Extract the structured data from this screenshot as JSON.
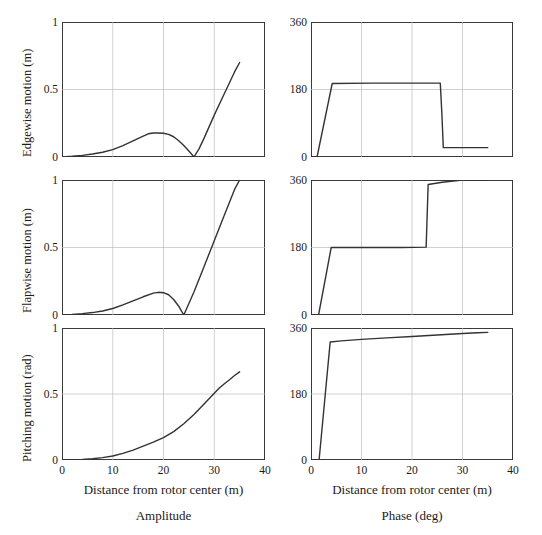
{
  "figure": {
    "column_captions": [
      "Amplitude",
      "Phase (deg)"
    ],
    "x_axis_title": "Distance from rotor center (m)",
    "row_titles": [
      "Edgewise motion (m)",
      "Flapwise motion (m)",
      "Pitching motion (rad)"
    ],
    "line_color": "#333333",
    "grid_color": "#bdbdbd",
    "frame_color": "#3a3a3a"
  },
  "axes": {
    "x_ticks": [
      "0",
      "10",
      "20",
      "30",
      "40"
    ],
    "x_tick_values": [
      0,
      10,
      20,
      30,
      40
    ],
    "amp_y_ticks": [
      "0",
      "0.5",
      "1"
    ],
    "amp_y_tick_values": [
      0,
      0.5,
      1
    ],
    "phase_y_ticks": [
      "0",
      "180",
      "360"
    ],
    "phase_y_tick_values": [
      0,
      180,
      360
    ]
  },
  "chart_data": [
    {
      "type": "line",
      "id": "edgewise-amplitude",
      "title": "",
      "xlabel": "Distance from rotor center (m)",
      "ylabel": "Edgewise motion (m)",
      "xlim": [
        0,
        40
      ],
      "ylim": [
        0,
        1
      ],
      "xticks": [
        0,
        10,
        20,
        30,
        40
      ],
      "yticks": [
        0,
        0.5,
        1
      ],
      "grid": true,
      "legend": "none",
      "series": [
        {
          "name": "Edgewise amplitude",
          "x": [
            0,
            2,
            4,
            6,
            8,
            10,
            12,
            14,
            16,
            17,
            18,
            19,
            20,
            21,
            22,
            23,
            24,
            25,
            26,
            27,
            28,
            30,
            32,
            34,
            35
          ],
          "y": [
            0.0,
            0.005,
            0.012,
            0.022,
            0.035,
            0.055,
            0.085,
            0.12,
            0.155,
            0.172,
            0.178,
            0.178,
            0.176,
            0.168,
            0.15,
            0.12,
            0.085,
            0.045,
            0.0,
            0.06,
            0.14,
            0.31,
            0.47,
            0.63,
            0.7
          ]
        }
      ]
    },
    {
      "type": "line",
      "id": "edgewise-phase",
      "title": "",
      "xlabel": "Distance from rotor center (m)",
      "ylabel": "Phase (deg)",
      "xlim": [
        0,
        40
      ],
      "ylim": [
        0,
        360
      ],
      "xticks": [
        0,
        10,
        20,
        30,
        40
      ],
      "yticks": [
        0,
        180,
        360
      ],
      "grid": true,
      "legend": "none",
      "series": [
        {
          "name": "Edgewise phase",
          "x": [
            0,
            1.2,
            4.2,
            12,
            20,
            25.6,
            25.9,
            26.2,
            30,
            35
          ],
          "y": [
            0,
            0,
            196,
            197,
            197,
            197,
            120,
            25,
            25,
            25
          ]
        }
      ]
    },
    {
      "type": "line",
      "id": "flapwise-amplitude",
      "title": "",
      "xlabel": "Distance from rotor center (m)",
      "ylabel": "Flapwise motion (m)",
      "xlim": [
        0,
        40
      ],
      "ylim": [
        0,
        1
      ],
      "xticks": [
        0,
        10,
        20,
        30,
        40
      ],
      "yticks": [
        0,
        0.5,
        1
      ],
      "grid": true,
      "legend": "none",
      "series": [
        {
          "name": "Flapwise amplitude",
          "x": [
            0,
            2,
            4,
            6,
            8,
            10,
            12,
            14,
            16,
            18,
            19,
            20,
            21,
            22,
            23,
            24,
            25,
            26,
            28,
            30,
            32,
            34,
            35
          ],
          "y": [
            0.0,
            0.004,
            0.01,
            0.018,
            0.03,
            0.048,
            0.075,
            0.105,
            0.135,
            0.162,
            0.168,
            0.165,
            0.15,
            0.115,
            0.065,
            0.0,
            0.085,
            0.17,
            0.36,
            0.55,
            0.74,
            0.93,
            1.0
          ]
        }
      ]
    },
    {
      "type": "line",
      "id": "flapwise-phase",
      "title": "",
      "xlabel": "Distance from rotor center (m)",
      "ylabel": "Phase (deg)",
      "xlim": [
        0,
        40
      ],
      "ylim": [
        0,
        360
      ],
      "xticks": [
        0,
        10,
        20,
        30,
        40
      ],
      "yticks": [
        0,
        180,
        360
      ],
      "grid": true,
      "legend": "none",
      "series": [
        {
          "name": "Flapwise phase",
          "x": [
            0,
            1.5,
            4.0,
            10,
            18,
            22.8,
            23.0,
            23.2,
            26,
            30,
            35
          ],
          "y": [
            0,
            0,
            180,
            180,
            180,
            181,
            265,
            348,
            354,
            360,
            360
          ]
        }
      ]
    },
    {
      "type": "line",
      "id": "pitching-amplitude",
      "title": "",
      "xlabel": "Distance from rotor center (m)",
      "ylabel": "Pitching motion (rad)",
      "xlim": [
        0,
        40
      ],
      "ylim": [
        0,
        1
      ],
      "xticks": [
        0,
        10,
        20,
        30,
        40
      ],
      "yticks": [
        0,
        0.5,
        1
      ],
      "grid": true,
      "legend": "none",
      "series": [
        {
          "name": "Pitching amplitude",
          "x": [
            0,
            2,
            4,
            6,
            8,
            10,
            12,
            14,
            16,
            18,
            20,
            22,
            24,
            26,
            28,
            30,
            31,
            32,
            33,
            34,
            35
          ],
          "y": [
            0.0,
            0.002,
            0.005,
            0.01,
            0.018,
            0.03,
            0.05,
            0.075,
            0.105,
            0.135,
            0.17,
            0.215,
            0.275,
            0.345,
            0.425,
            0.505,
            0.545,
            0.578,
            0.608,
            0.64,
            0.668
          ]
        }
      ]
    },
    {
      "type": "line",
      "id": "pitching-phase",
      "title": "",
      "xlabel": "Distance from rotor center (m)",
      "ylabel": "Phase (deg)",
      "xlim": [
        0,
        40
      ],
      "ylim": [
        0,
        360
      ],
      "xticks": [
        0,
        10,
        20,
        30,
        40
      ],
      "yticks": [
        0,
        180,
        360
      ],
      "grid": true,
      "legend": "none",
      "series": [
        {
          "name": "Pitching phase",
          "x": [
            0,
            1.6,
            3.8,
            6,
            10,
            15,
            20,
            25,
            30,
            33,
            35
          ],
          "y": [
            0,
            0,
            322,
            325,
            329,
            333,
            337,
            341,
            345,
            347,
            348
          ]
        }
      ]
    }
  ]
}
